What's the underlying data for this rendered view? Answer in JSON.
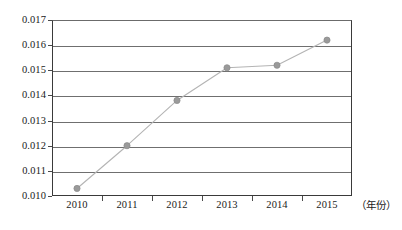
{
  "chart_data": {
    "type": "line",
    "title": "",
    "subtitle": "",
    "xlabel": "（年份）",
    "ylabel": "",
    "categories": [
      "2010",
      "2011",
      "2012",
      "2013",
      "2014",
      "2015"
    ],
    "x": [
      2010,
      2011,
      2012,
      2013,
      2014,
      2015
    ],
    "values": [
      0.0103,
      0.012,
      0.0138,
      0.0151,
      0.0152,
      0.0162
    ],
    "series": [
      {
        "name": "",
        "values": [
          0.0103,
          0.012,
          0.0138,
          0.0151,
          0.0152,
          0.0162
        ]
      }
    ],
    "ylim": [
      0.01,
      0.017
    ],
    "ytick_labels": [
      "0.010",
      "0.011",
      "0.012",
      "0.013",
      "0.014",
      "0.015",
      "0.016",
      "0.017"
    ],
    "ytick_values": [
      0.01,
      0.011,
      0.012,
      0.013,
      0.014,
      0.015,
      0.016,
      0.017
    ],
    "grid": true,
    "grid_axis": "y",
    "legend": false,
    "legend_position": "none",
    "markers": true,
    "annotations": []
  },
  "style": {
    "line_color": "#b4b4b4",
    "marker_fill": "#9a9a9a",
    "marker_stroke": "#8a8a8a",
    "grid_color": "#6f6f6f",
    "axis_color": "#3a3a3a",
    "text_color": "#1a1a1a",
    "background": "#ffffff"
  },
  "axis": {
    "x_title": "（年份）"
  }
}
